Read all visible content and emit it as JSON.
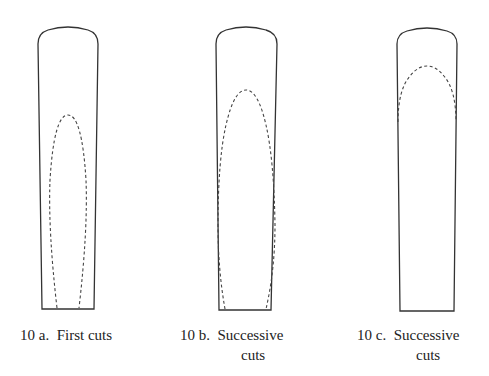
{
  "figures": [
    {
      "id": "10a",
      "label_number": "10 a.",
      "label_line1": "First cuts",
      "label_line2": ""
    },
    {
      "id": "10b",
      "label_number": "10 b.",
      "label_line1": "Successive",
      "label_line2": "cuts"
    },
    {
      "id": "10c",
      "label_number": "10 c.",
      "label_line1": "Successive",
      "label_line2": "cuts"
    }
  ],
  "colors": {
    "outline": "#333333",
    "cut_line": "#444444",
    "background": "#ffffff"
  }
}
